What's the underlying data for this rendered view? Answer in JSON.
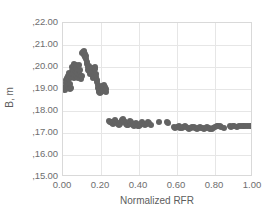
{
  "chart_data": {
    "type": "scatter",
    "title": "",
    "xlabel": "Normalized RFR",
    "ylabel": "B, m",
    "xlim": [
      0.0,
      1.0
    ],
    "ylim": [
      15.0,
      22.0
    ],
    "grid": true,
    "legend": null,
    "marker_color": "#636363",
    "gridline_color": "#e6e6e6",
    "axis_color": "#d9d9d9",
    "xticks": [
      "0.00",
      "0.20",
      "0.40",
      "0.60",
      "0.80",
      "1.00"
    ],
    "xtick_values": [
      0.0,
      0.2,
      0.4,
      0.6,
      0.8,
      1.0
    ],
    "yticks": [
      ",15.00",
      ",16.00",
      ",17.00",
      ",18.00",
      ",19.00",
      ",20.00",
      ",21.00",
      ",22.00"
    ],
    "ytick_values": [
      15.0,
      16.0,
      17.0,
      18.0,
      19.0,
      20.0,
      21.0,
      22.0
    ],
    "series": [
      {
        "name": "B",
        "points": [
          [
            0.005,
            19.02
          ],
          [
            0.008,
            18.95
          ],
          [
            0.012,
            19.1
          ],
          [
            0.015,
            19.28
          ],
          [
            0.018,
            19.4
          ],
          [
            0.02,
            19.52
          ],
          [
            0.022,
            19.33
          ],
          [
            0.025,
            19.15
          ],
          [
            0.028,
            19.6
          ],
          [
            0.03,
            19.72
          ],
          [
            0.032,
            19.45
          ],
          [
            0.035,
            19.25
          ],
          [
            0.038,
            18.98
          ],
          [
            0.04,
            19.05
          ],
          [
            0.043,
            19.55
          ],
          [
            0.046,
            19.8
          ],
          [
            0.048,
            20.02
          ],
          [
            0.05,
            19.9
          ],
          [
            0.053,
            19.68
          ],
          [
            0.056,
            19.48
          ],
          [
            0.058,
            20.15
          ],
          [
            0.06,
            20.05
          ],
          [
            0.063,
            19.85
          ],
          [
            0.066,
            19.62
          ],
          [
            0.068,
            19.95
          ],
          [
            0.07,
            20.1
          ],
          [
            0.073,
            19.75
          ],
          [
            0.076,
            19.58
          ],
          [
            0.079,
            19.5
          ],
          [
            0.082,
            19.7
          ],
          [
            0.085,
            20.08
          ],
          [
            0.088,
            19.88
          ],
          [
            0.09,
            19.65
          ],
          [
            0.093,
            19.55
          ],
          [
            0.096,
            19.45
          ],
          [
            0.099,
            19.6
          ],
          [
            0.102,
            20.62
          ],
          [
            0.105,
            20.7
          ],
          [
            0.108,
            20.55
          ],
          [
            0.11,
            20.66
          ],
          [
            0.112,
            20.75
          ],
          [
            0.115,
            20.58
          ],
          [
            0.118,
            20.45
          ],
          [
            0.12,
            20.35
          ],
          [
            0.123,
            20.48
          ],
          [
            0.126,
            20.25
          ],
          [
            0.128,
            20.15
          ],
          [
            0.13,
            19.98
          ],
          [
            0.133,
            19.88
          ],
          [
            0.136,
            20.05
          ],
          [
            0.139,
            19.8
          ],
          [
            0.142,
            19.68
          ],
          [
            0.145,
            19.72
          ],
          [
            0.148,
            19.85
          ],
          [
            0.15,
            19.95
          ],
          [
            0.153,
            19.75
          ],
          [
            0.156,
            19.6
          ],
          [
            0.159,
            19.52
          ],
          [
            0.162,
            19.65
          ],
          [
            0.165,
            19.78
          ],
          [
            0.168,
            19.9
          ],
          [
            0.17,
            20.0
          ],
          [
            0.173,
            19.7
          ],
          [
            0.176,
            19.55
          ],
          [
            0.178,
            19.42
          ],
          [
            0.18,
            19.3
          ],
          [
            0.183,
            19.18
          ],
          [
            0.186,
            19.05
          ],
          [
            0.189,
            18.92
          ],
          [
            0.192,
            18.85
          ],
          [
            0.195,
            18.8
          ],
          [
            0.198,
            18.88
          ],
          [
            0.2,
            19.0
          ],
          [
            0.203,
            19.12
          ],
          [
            0.206,
            19.05
          ],
          [
            0.209,
            18.95
          ],
          [
            0.212,
            18.9
          ],
          [
            0.215,
            19.08
          ],
          [
            0.218,
            19.18
          ],
          [
            0.221,
            19.1
          ],
          [
            0.224,
            18.98
          ],
          [
            0.227,
            18.88
          ],
          [
            0.243,
            17.55
          ],
          [
            0.248,
            17.52
          ],
          [
            0.252,
            17.48
          ],
          [
            0.256,
            17.5
          ],
          [
            0.26,
            17.45
          ],
          [
            0.264,
            17.42
          ],
          [
            0.268,
            17.48
          ],
          [
            0.272,
            17.55
          ],
          [
            0.276,
            17.6
          ],
          [
            0.28,
            17.52
          ],
          [
            0.285,
            17.45
          ],
          [
            0.29,
            17.4
          ],
          [
            0.295,
            17.38
          ],
          [
            0.3,
            17.42
          ],
          [
            0.305,
            17.5
          ],
          [
            0.31,
            17.58
          ],
          [
            0.315,
            17.62
          ],
          [
            0.32,
            17.55
          ],
          [
            0.325,
            17.48
          ],
          [
            0.33,
            17.42
          ],
          [
            0.335,
            17.38
          ],
          [
            0.34,
            17.35
          ],
          [
            0.345,
            17.4
          ],
          [
            0.35,
            17.48
          ],
          [
            0.355,
            17.55
          ],
          [
            0.36,
            17.5
          ],
          [
            0.365,
            17.42
          ],
          [
            0.37,
            17.36
          ],
          [
            0.375,
            17.32
          ],
          [
            0.38,
            17.38
          ],
          [
            0.385,
            17.45
          ],
          [
            0.39,
            17.4
          ],
          [
            0.395,
            17.34
          ],
          [
            0.4,
            17.3
          ],
          [
            0.405,
            17.36
          ],
          [
            0.41,
            17.42
          ],
          [
            0.418,
            17.48
          ],
          [
            0.425,
            17.4
          ],
          [
            0.432,
            17.35
          ],
          [
            0.44,
            17.42
          ],
          [
            0.448,
            17.5
          ],
          [
            0.455,
            17.45
          ],
          [
            0.462,
            17.38
          ],
          [
            0.505,
            17.52
          ],
          [
            0.545,
            17.48
          ],
          [
            0.555,
            17.45
          ],
          [
            0.585,
            17.28
          ],
          [
            0.592,
            17.24
          ],
          [
            0.6,
            17.26
          ],
          [
            0.608,
            17.3
          ],
          [
            0.616,
            17.25
          ],
          [
            0.624,
            17.22
          ],
          [
            0.632,
            17.26
          ],
          [
            0.64,
            17.3
          ],
          [
            0.648,
            17.28
          ],
          [
            0.656,
            17.24
          ],
          [
            0.664,
            17.2
          ],
          [
            0.672,
            17.24
          ],
          [
            0.68,
            17.28
          ],
          [
            0.688,
            17.26
          ],
          [
            0.696,
            17.22
          ],
          [
            0.704,
            17.2
          ],
          [
            0.712,
            17.24
          ],
          [
            0.72,
            17.28
          ],
          [
            0.728,
            17.25
          ],
          [
            0.736,
            17.21
          ],
          [
            0.744,
            17.19
          ],
          [
            0.752,
            17.23
          ],
          [
            0.76,
            17.27
          ],
          [
            0.768,
            17.24
          ],
          [
            0.776,
            17.2
          ],
          [
            0.784,
            17.18
          ],
          [
            0.792,
            17.22
          ],
          [
            0.8,
            17.26
          ],
          [
            0.808,
            17.3
          ],
          [
            0.816,
            17.34
          ],
          [
            0.824,
            17.3
          ],
          [
            0.832,
            17.26
          ],
          [
            0.845,
            17.24
          ],
          [
            0.878,
            17.3
          ],
          [
            0.886,
            17.28
          ],
          [
            0.894,
            17.32
          ],
          [
            0.902,
            17.3
          ],
          [
            0.915,
            17.26
          ],
          [
            0.925,
            17.3
          ],
          [
            0.935,
            17.34
          ],
          [
            0.945,
            17.3
          ],
          [
            0.955,
            17.32
          ],
          [
            0.965,
            17.34
          ],
          [
            0.975,
            17.32
          ],
          [
            0.985,
            17.34
          ],
          [
            0.995,
            17.33
          ]
        ]
      }
    ]
  }
}
